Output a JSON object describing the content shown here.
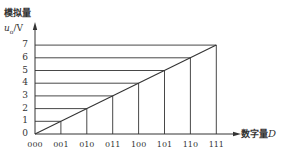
{
  "chart_data": {
    "type": "line",
    "title": "",
    "ylabel_top": "模拟量",
    "ylabel": "u_o/V",
    "xlabel": "数字量D",
    "categories": [
      "000",
      "001",
      "010",
      "011",
      "100",
      "101",
      "110",
      "111"
    ],
    "values": [
      0,
      1,
      2,
      3,
      4,
      5,
      6,
      7
    ],
    "ylim": [
      0,
      7
    ],
    "yticks": [
      "0",
      "1",
      "2",
      "3",
      "4",
      "5",
      "6",
      "7"
    ],
    "grid": "horizontal lines from each y tick to the ramp; vertical lines from each x tick to the ramp",
    "legend": null
  },
  "labels": {
    "y_axis_title": "模拟量",
    "y_axis_unit_var": "u",
    "y_axis_unit_sub": "o",
    "y_axis_unit_rest": "/V",
    "x_axis_title": "数字量",
    "x_axis_var": "D"
  },
  "colors": {
    "line": "#333333",
    "text": "#333333",
    "background": "#ffffff"
  }
}
